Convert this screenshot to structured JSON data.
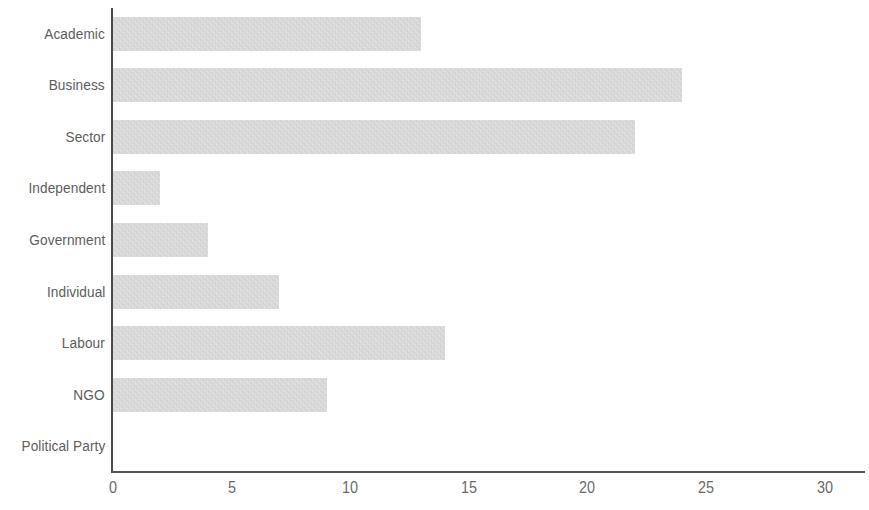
{
  "chart_data": {
    "type": "bar",
    "orientation": "horizontal",
    "title": "",
    "subtitle": "",
    "xlabel": "",
    "ylabel": "",
    "categories": [
      "Academic",
      "Business",
      "Sector",
      "Independent",
      "Government",
      "Individual",
      "Labour",
      "NGO",
      "Political Party"
    ],
    "values": [
      13,
      24,
      22,
      2,
      4,
      7,
      14,
      9,
      0
    ],
    "xlim": [
      0,
      31.7
    ],
    "xticks": [
      0,
      5,
      10,
      15,
      20,
      25,
      30
    ],
    "xtick_labels": [
      "0",
      "5",
      "10",
      "15",
      "20",
      "25",
      "30"
    ],
    "grid": false,
    "legend": null,
    "bar_color": "#c9c9c9",
    "axis_color": "#4a4a4a",
    "label_color": "#5d5d5d",
    "background_color": "#ffffff"
  }
}
